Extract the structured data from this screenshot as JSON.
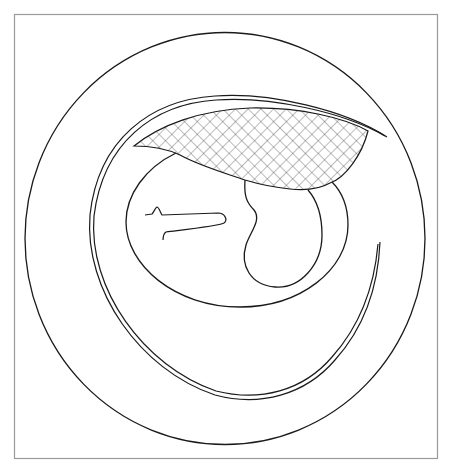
{
  "diagram": {
    "kind": "line-drawing",
    "description": "Schematic cross-section: outer circle enclosing a double-line spiral sheath, an inner oval with a kidney-shaped lobe, a small hooked line, and a crosshatched crescent region at the top.",
    "frame": {
      "x": 14,
      "y": 14,
      "width": 424,
      "height": 445,
      "stroke": "#9a9a9a"
    },
    "colors": {
      "line": "#1a1a1a",
      "frame": "#9a9a9a",
      "background": "#ffffff",
      "hatch": "#555555"
    },
    "elements": [
      {
        "id": "outer-circle",
        "label": "outer circle"
      },
      {
        "id": "double-spiral",
        "label": "double-line spiral sheath"
      },
      {
        "id": "inner-oval",
        "label": "inner oval"
      },
      {
        "id": "kidney-lobe",
        "label": "kidney-shaped lobe"
      },
      {
        "id": "hook-line",
        "label": "small hooked line"
      },
      {
        "id": "hatched-region",
        "label": "crosshatched crescent region"
      }
    ]
  }
}
